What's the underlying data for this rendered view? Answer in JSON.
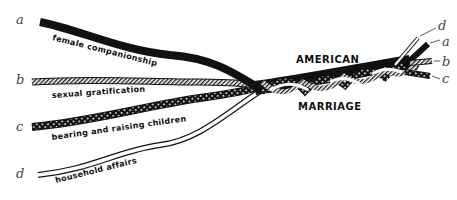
{
  "diagram": {
    "title_top": "AMERICAN",
    "title_bottom": "MARRIAGE",
    "strands": [
      {
        "letter": "a",
        "label": "female companionship",
        "pattern": "solid-black"
      },
      {
        "letter": "b",
        "label": "sexual gratification",
        "pattern": "diagonal-hatch"
      },
      {
        "letter": "c",
        "label": "bearing and raising children",
        "pattern": "checkered"
      },
      {
        "letter": "d",
        "label": "household affairs",
        "pattern": "white-outline"
      }
    ],
    "right_letters": [
      "d",
      "a",
      "b",
      "c"
    ],
    "colors": {
      "ink": "#111111",
      "letter": "#444444",
      "background": "#ffffff"
    }
  }
}
